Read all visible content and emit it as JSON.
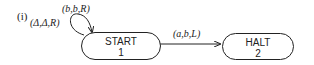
{
  "figure_label": "(i)",
  "states": [
    {
      "name": "START",
      "number": "1"
    },
    {
      "name": "HALT",
      "number": "2"
    }
  ],
  "transitions": [
    {
      "from": "START",
      "to": "START",
      "labels": [
        "(b,b,R)",
        "(Δ,Δ,R)"
      ]
    },
    {
      "from": "START",
      "to": "HALT",
      "label": "(a,b,L)"
    }
  ],
  "loop_label_1": "(b,b,R)",
  "loop_label_2": "(Δ,Δ,R)",
  "edge_label": "(a,b,L)"
}
